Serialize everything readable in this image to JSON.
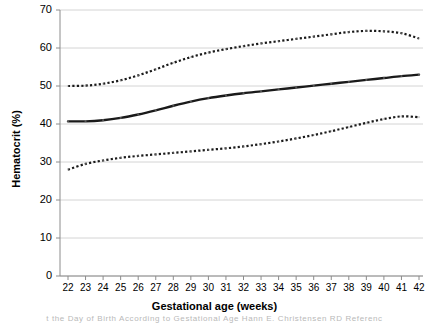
{
  "figure": {
    "background_color": "#ffffff",
    "caption_fragment": "t the Day of Birth According to Gestational Age   Hann E. Christensen RD  Referenc"
  },
  "chart_data": {
    "type": "line",
    "title": "",
    "subtitle": "",
    "xlabel": "Gestational age (weeks)",
    "ylabel": "Hematocrit (%)",
    "xlim": [
      21.5,
      42.5
    ],
    "ylim": [
      0,
      70
    ],
    "grid": "horizontal",
    "legend_position": "none",
    "y_ticks": [
      0,
      10,
      20,
      30,
      40,
      50,
      60,
      70
    ],
    "y_tick_labels": [
      "0",
      "10",
      "20",
      "30",
      "40",
      "50",
      "60",
      "70"
    ],
    "x": [
      22,
      23,
      24,
      25,
      26,
      27,
      28,
      29,
      30,
      31,
      32,
      33,
      34,
      35,
      36,
      37,
      38,
      39,
      40,
      41,
      42
    ],
    "x_tick_labels": [
      "22",
      "23",
      "24",
      "25",
      "26",
      "27",
      "28",
      "29",
      "30",
      "31",
      "32",
      "33",
      "34",
      "35",
      "36",
      "37",
      "38",
      "39",
      "40",
      "41",
      "42"
    ],
    "colors": {
      "line": "#1a1a1a",
      "gridline": "#d4d4d4",
      "axis": "#8c8c8c"
    },
    "series": [
      {
        "name": "Upper percentile",
        "style": "dotted",
        "color": "#1a1a1a",
        "values": [
          50.0,
          50.1,
          50.6,
          51.5,
          52.8,
          54.4,
          56.1,
          57.6,
          58.8,
          59.7,
          60.5,
          61.2,
          61.8,
          62.4,
          63.0,
          63.6,
          64.2,
          64.5,
          64.4,
          63.9,
          62.5
        ]
      },
      {
        "name": "Median",
        "style": "solid",
        "color": "#1a1a1a",
        "values": [
          40.7,
          40.7,
          41.0,
          41.6,
          42.5,
          43.6,
          44.8,
          45.9,
          46.8,
          47.5,
          48.1,
          48.6,
          49.1,
          49.6,
          50.1,
          50.6,
          51.1,
          51.6,
          52.1,
          52.6,
          53.0
        ]
      },
      {
        "name": "Lower percentile",
        "style": "dotted",
        "color": "#1a1a1a",
        "values": [
          28.0,
          29.5,
          30.4,
          31.1,
          31.6,
          32.0,
          32.4,
          32.8,
          33.2,
          33.6,
          34.1,
          34.7,
          35.4,
          36.2,
          37.1,
          38.1,
          39.2,
          40.3,
          41.3,
          42.0,
          41.8
        ]
      }
    ]
  }
}
